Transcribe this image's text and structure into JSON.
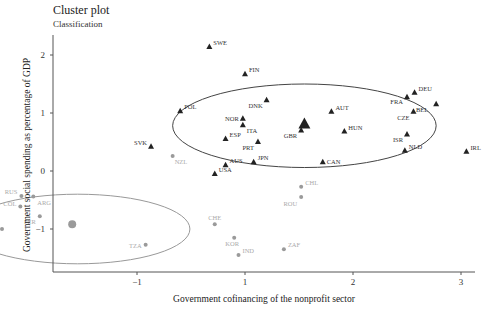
{
  "chart_data": {
    "type": "scatter",
    "title": "Cluster plot",
    "subtitle": "Classification",
    "xlabel": "Government cofinancing of the nonprofit sector",
    "ylabel": "Government social spending as percentage of GDP",
    "x_ticks": [
      {
        "label": "−1",
        "value": -1
      },
      {
        "label": "1",
        "value": 1
      },
      {
        "label": "2",
        "value": 2
      },
      {
        "label": "3",
        "value": 3
      }
    ],
    "y_ticks": [
      {
        "label": "2",
        "value": 2
      },
      {
        "label": "1",
        "value": 1
      },
      {
        "label": "0",
        "value": 0
      },
      {
        "label": "−1",
        "value": -1
      }
    ],
    "xlim": [
      -1.8,
      3.15
    ],
    "ylim": [
      -1.75,
      2.6
    ],
    "grid": false,
    "legend": null,
    "colors": {
      "cluster1": "#222222",
      "cluster2": "#9a9a9a",
      "axis": "#555555"
    },
    "series": [
      {
        "name": "Cluster 1",
        "marker": "triangle",
        "color": "#222222",
        "centroid": {
          "x": 1.55,
          "y": 0.8
        },
        "ellipse": {
          "cx": 1.55,
          "cy": 0.78,
          "rx": 1.22,
          "ry": 0.72
        },
        "points": [
          {
            "label": "SWE",
            "x": 0.67,
            "y": 2.14,
            "lx": 4,
            "ly": -2,
            "anchor": "start"
          },
          {
            "label": "FIN",
            "x": 1.0,
            "y": 1.67,
            "lx": 4,
            "ly": -2,
            "anchor": "start"
          },
          {
            "label": "POL",
            "x": 0.4,
            "y": 1.03,
            "lx": 4,
            "ly": -2,
            "anchor": "start"
          },
          {
            "label": "DNK",
            "x": 1.2,
            "y": 1.22,
            "lx": -4,
            "ly": 8,
            "anchor": "end"
          },
          {
            "label": "AUT",
            "x": 1.8,
            "y": 1.02,
            "lx": 4,
            "ly": -2,
            "anchor": "start"
          },
          {
            "label": "NOR",
            "x": 0.98,
            "y": 0.9,
            "lx": -4,
            "ly": 2,
            "anchor": "end"
          },
          {
            "label": "ITA",
            "x": 0.98,
            "y": 0.79,
            "lx": 4,
            "ly": 8,
            "anchor": "start"
          },
          {
            "label": "ESP",
            "x": 0.82,
            "y": 0.55,
            "lx": 4,
            "ly": -2,
            "anchor": "start"
          },
          {
            "label": "PRT",
            "x": 1.12,
            "y": 0.5,
            "lx": -4,
            "ly": 8,
            "anchor": "end"
          },
          {
            "label": "GBR",
            "x": 1.52,
            "y": 0.7,
            "lx": -4,
            "ly": 8,
            "anchor": "end"
          },
          {
            "label": "HUN",
            "x": 1.92,
            "y": 0.68,
            "lx": 4,
            "ly": -2,
            "anchor": "start"
          },
          {
            "label": "SVK",
            "x": 0.13,
            "y": 0.42,
            "lx": -4,
            "ly": -2,
            "anchor": "end"
          },
          {
            "label": "USA",
            "x": 0.72,
            "y": -0.05,
            "lx": 4,
            "ly": -2,
            "anchor": "start"
          },
          {
            "label": "AUS",
            "x": 0.82,
            "y": 0.1,
            "lx": 4,
            "ly": -2,
            "anchor": "start"
          },
          {
            "label": "JPN",
            "x": 1.08,
            "y": 0.15,
            "lx": 4,
            "ly": -2,
            "anchor": "start"
          },
          {
            "label": "CAN",
            "x": 1.72,
            "y": 0.15,
            "lx": 4,
            "ly": 2,
            "anchor": "start"
          },
          {
            "label": "DEU",
            "x": 2.57,
            "y": 1.35,
            "lx": 4,
            "ly": -2,
            "anchor": "start"
          },
          {
            "label": "FRA",
            "x": 2.5,
            "y": 1.27,
            "lx": -4,
            "ly": 7,
            "anchor": "end"
          },
          {
            "label": "BEL",
            "x": 2.77,
            "y": 1.15,
            "lx": -8,
            "ly": 8,
            "anchor": "end"
          },
          {
            "label": "CZE",
            "x": 2.56,
            "y": 1.02,
            "lx": -4,
            "ly": 8,
            "anchor": "end"
          },
          {
            "label": "ISR",
            "x": 2.5,
            "y": 0.63,
            "lx": -4,
            "ly": 8,
            "anchor": "end"
          },
          {
            "label": "NLD",
            "x": 2.48,
            "y": 0.35,
            "lx": 4,
            "ly": -2,
            "anchor": "start"
          },
          {
            "label": "IRL",
            "x": 3.05,
            "y": 0.33,
            "lx": 4,
            "ly": -2,
            "anchor": "start"
          }
        ]
      },
      {
        "name": "Cluster 2",
        "marker": "circle",
        "color": "#9a9a9a",
        "centroid": {
          "x": -0.6,
          "y": -0.92
        },
        "ellipse": {
          "cx": -0.55,
          "cy": -1.0,
          "rx": 1.04,
          "ry": 0.6
        },
        "points": [
          {
            "label": "NZL",
            "x": 0.33,
            "y": 0.26,
            "lx": 2,
            "ly": 8,
            "anchor": "start"
          },
          {
            "label": "BRA",
            "x": -1.48,
            "y": -0.27,
            "lx": -4,
            "ly": 6,
            "anchor": "end"
          },
          {
            "label": "RUS",
            "x": -1.07,
            "y": -0.43,
            "lx": -4,
            "ly": -2,
            "anchor": "end"
          },
          {
            "label": "ARG",
            "x": -0.96,
            "y": -0.44,
            "lx": 4,
            "ly": 8,
            "anchor": "start"
          },
          {
            "label": "COL",
            "x": -1.08,
            "y": -0.61,
            "lx": -4,
            "ly": 0,
            "anchor": "end"
          },
          {
            "label": "PER",
            "x": -0.9,
            "y": -0.78,
            "lx": -4,
            "ly": 8,
            "anchor": "end"
          },
          {
            "label": "MEX",
            "x": -1.25,
            "y": -1.0,
            "lx": -4,
            "ly": -2,
            "anchor": "end"
          },
          {
            "label": "UGA",
            "x": -1.48,
            "y": -1.27,
            "lx": 4,
            "ly": 8,
            "anchor": "start"
          },
          {
            "label": "KEN",
            "x": -1.6,
            "y": -1.5,
            "lx": -4,
            "ly": -4,
            "anchor": "end"
          },
          {
            "label": "PHL",
            "x": -1.58,
            "y": -1.52,
            "lx": -2,
            "ly": 9,
            "anchor": "end"
          },
          {
            "label": "PAK",
            "x": -1.54,
            "y": -1.5,
            "lx": 4,
            "ly": 8,
            "anchor": "start"
          },
          {
            "label": "TZA",
            "x": 0.08,
            "y": -1.27,
            "lx": -4,
            "ly": 3,
            "anchor": "end"
          },
          {
            "label": "CHE",
            "x": 0.72,
            "y": -0.92,
            "lx": 0,
            "ly": -4,
            "anchor": "middle"
          },
          {
            "label": "KOR",
            "x": 0.9,
            "y": -1.15,
            "lx": -2,
            "ly": 8,
            "anchor": "middle"
          },
          {
            "label": "IND",
            "x": 0.94,
            "y": -1.45,
            "lx": 4,
            "ly": -2,
            "anchor": "start"
          },
          {
            "label": "ZAF",
            "x": 1.36,
            "y": -1.35,
            "lx": 4,
            "ly": -2,
            "anchor": "start"
          },
          {
            "label": "CHL",
            "x": 1.52,
            "y": -0.27,
            "lx": 4,
            "ly": -2,
            "anchor": "start"
          },
          {
            "label": "ROU",
            "x": 1.52,
            "y": -0.45,
            "lx": -4,
            "ly": 9,
            "anchor": "end"
          }
        ]
      }
    ]
  }
}
